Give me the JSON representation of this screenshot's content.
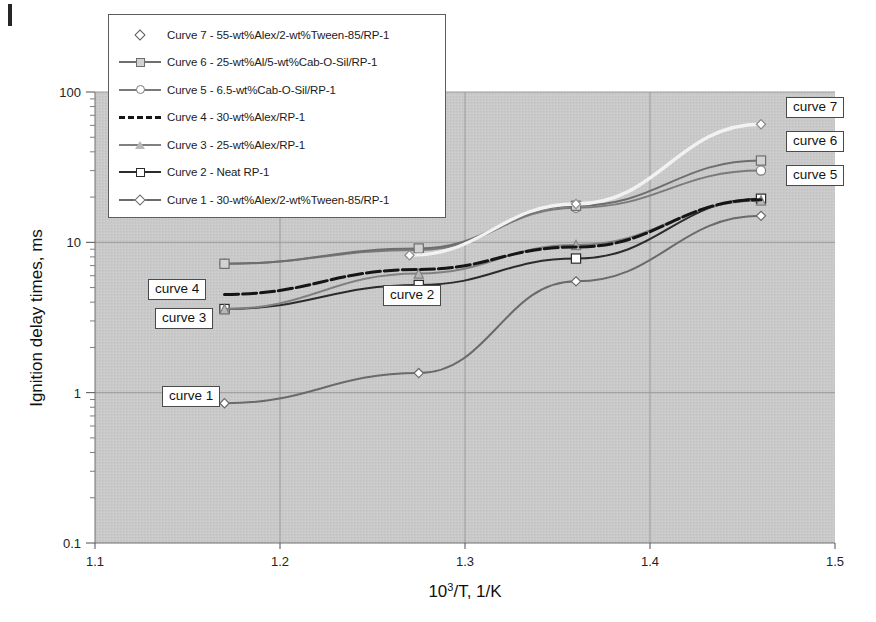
{
  "figure": {
    "scan_artifact": "black-bar-top-left"
  },
  "axes": {
    "x": {
      "title_main": "10",
      "title_sup": "3",
      "title_rest": "/T, 1/K",
      "ticks": [
        "1.1",
        "1.2",
        "1.3",
        "1.4",
        "1.5"
      ],
      "values": [
        1.1,
        1.2,
        1.3,
        1.4,
        1.5
      ],
      "min": 1.1,
      "max": 1.5
    },
    "y": {
      "title": "Ignition delay times, ms",
      "ticks": [
        "0.1",
        "1",
        "10",
        "100"
      ],
      "values": [
        0.1,
        1,
        10,
        100
      ],
      "min": 0.1,
      "max": 100,
      "scale": "log"
    }
  },
  "legend": {
    "entries": [
      {
        "label": "Curve 7 - 55-wt%Alex/2-wt%Tween-85/RP-1",
        "marker": "diamond",
        "line": "none",
        "color": "#5a5a5a",
        "fill": "#ffffff"
      },
      {
        "label": "Curve 6 - 25-wt%Al/5-wt%Cab-O-Sil/RP-1",
        "marker": "square",
        "line": "solid",
        "color": "#6e6e6e",
        "fill": "#d2d2d2"
      },
      {
        "label": "Curve 5 - 6.5-wt%Cab-O-Sil/RP-1",
        "marker": "circle",
        "line": "solid",
        "color": "#7a7a7a",
        "fill": "#ffffff"
      },
      {
        "label": "Curve 4 - 30-wt%Alex/RP-1",
        "marker": "none",
        "line": "dash",
        "color": "#151515",
        "fill": "#151515"
      },
      {
        "label": "Curve 3 - 25-wt%Alex/RP-1",
        "marker": "triangle",
        "line": "solid",
        "color": "#808080",
        "fill": "#b8b8b8"
      },
      {
        "label": "Curve 2 - Neat RP-1",
        "marker": "square",
        "line": "solid",
        "color": "#2b2b2b",
        "fill": "#ffffff"
      },
      {
        "label": "Curve 1 - 30-wt%Alex/2-wt%Tween-85/RP-1",
        "marker": "diamond",
        "line": "solid",
        "color": "#6a6a6a",
        "fill": "#ffffff"
      }
    ]
  },
  "annotations": [
    {
      "text": "curve 1",
      "x": 162,
      "y": 386
    },
    {
      "text": "curve 2",
      "x": 383,
      "y": 285
    },
    {
      "text": "curve 3",
      "x": 155,
      "y": 308
    },
    {
      "text": "curve 4",
      "x": 148,
      "y": 279
    },
    {
      "text": "curve 5",
      "x": 786,
      "y": 165
    },
    {
      "text": "curve 6",
      "x": 786,
      "y": 131
    },
    {
      "text": "curve 7",
      "x": 786,
      "y": 97
    }
  ],
  "chart_data": {
    "type": "line",
    "title": "",
    "xlabel": "10^3/T, 1/K",
    "ylabel": "Ignition delay times, ms",
    "xlim": [
      1.1,
      1.5
    ],
    "ylim": [
      0.1,
      100
    ],
    "yscale": "log",
    "grid": true,
    "legend_position": "top-left-inside",
    "series": [
      {
        "name": "Curve 1 - 30-wt%Alex/2-wt%Tween-85/RP-1",
        "color": "#6a6a6a",
        "marker": "diamond",
        "x": [
          1.17,
          1.275,
          1.36,
          1.46
        ],
        "y": [
          0.85,
          1.35,
          5.5,
          15.0
        ]
      },
      {
        "name": "Curve 2 - Neat RP-1",
        "color": "#2b2b2b",
        "marker": "square",
        "x": [
          1.17,
          1.275,
          1.36,
          1.46
        ],
        "y": [
          3.6,
          5.2,
          7.8,
          19.5
        ]
      },
      {
        "name": "Curve 3 - 25-wt%Alex/RP-1",
        "color": "#808080",
        "marker": "triangle",
        "x": [
          1.17,
          1.275,
          1.36,
          1.46
        ],
        "y": [
          3.6,
          6.2,
          9.6,
          19.0
        ]
      },
      {
        "name": "Curve 4 - 30-wt%Alex/RP-1",
        "color": "#151515",
        "marker": "none",
        "x": [
          1.17,
          1.275,
          1.36,
          1.46
        ],
        "y": [
          4.5,
          6.6,
          9.3,
          19.2
        ]
      },
      {
        "name": "Curve 5 - 6.5-wt%Cab-O-Sil/RP-1",
        "color": "#7a7a7a",
        "marker": "circle",
        "x": [
          1.17,
          1.275,
          1.36,
          1.46
        ],
        "y": [
          7.2,
          8.9,
          17.0,
          30.0
        ]
      },
      {
        "name": "Curve 6 - 25-wt%Al/5-wt%Cab-O-Sil/RP-1",
        "color": "#6e6e6e",
        "marker": "square",
        "x": [
          1.17,
          1.275,
          1.36,
          1.46
        ],
        "y": [
          7.2,
          9.1,
          17.5,
          35.0
        ]
      },
      {
        "name": "Curve 7 - 55-wt%Alex/2-wt%Tween-85/RP-1",
        "color": "#f2f2f2",
        "marker": "diamond",
        "x": [
          1.27,
          1.36,
          1.46
        ],
        "y": [
          8.2,
          18.0,
          61.0
        ]
      }
    ]
  }
}
